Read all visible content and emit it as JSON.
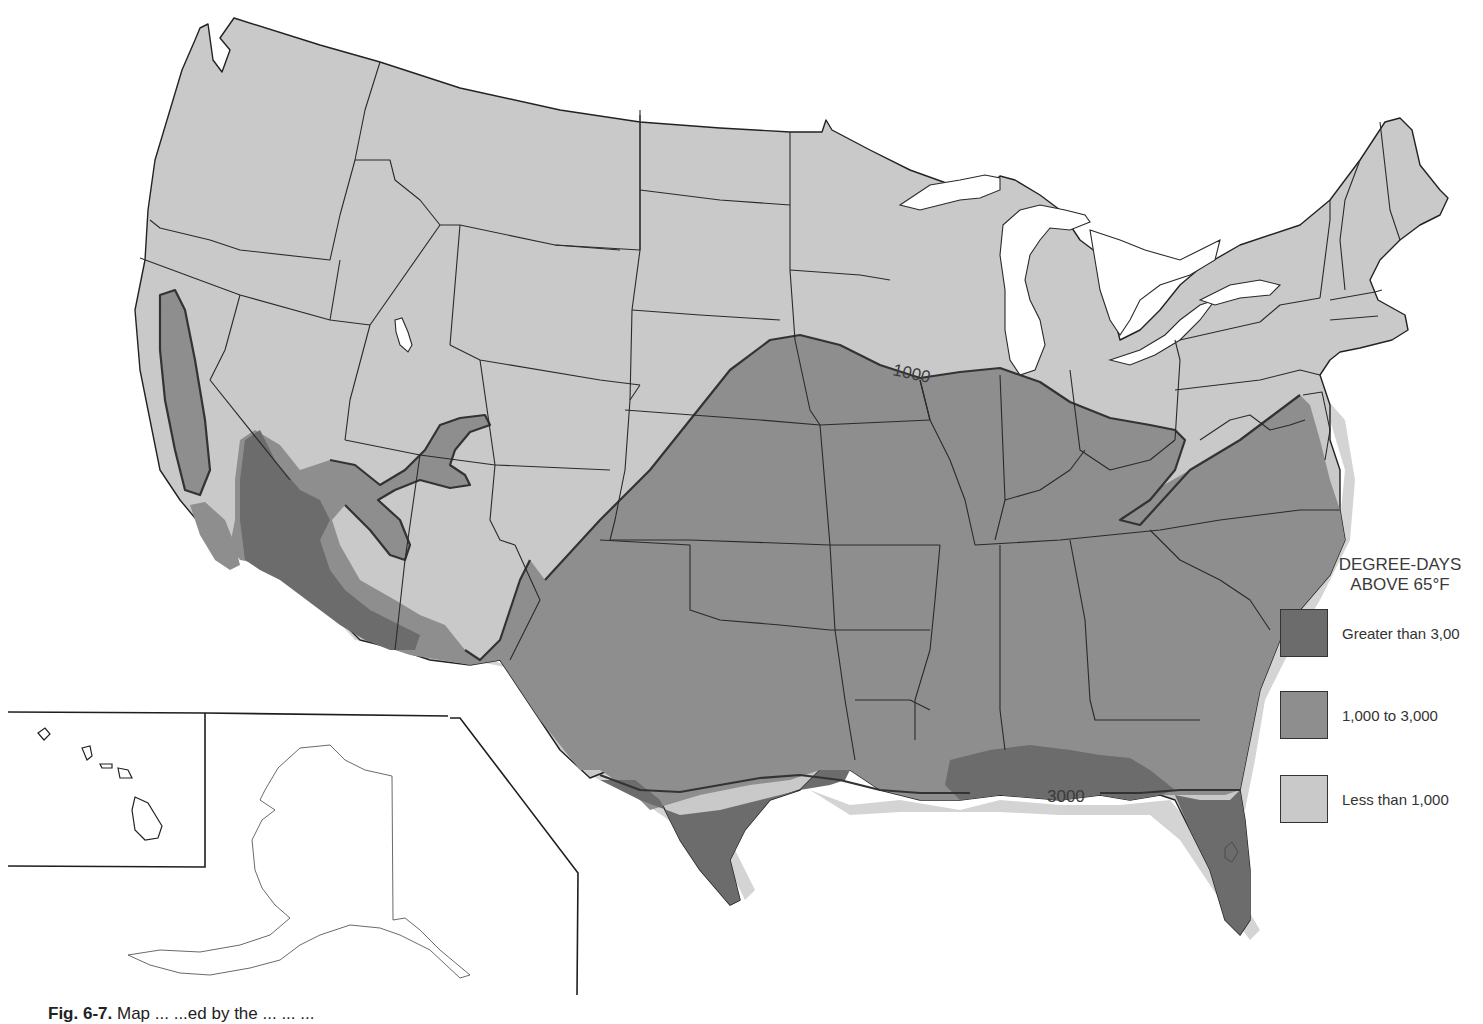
{
  "map": {
    "title": "Degree-days above 65°F, United States",
    "contour_labels": [
      {
        "id": "contour-1000",
        "text": "1000"
      },
      {
        "id": "contour-3000",
        "text": "3000"
      }
    ],
    "zones": [
      {
        "id": "less-than-1000",
        "color": "#c9c9c9"
      },
      {
        "id": "1000-to-3000",
        "color": "#8e8e8e"
      },
      {
        "id": "greater-than-3000",
        "color": "#6c6c6c"
      }
    ],
    "insets": [
      "Hawaii",
      "Alaska"
    ]
  },
  "legend": {
    "title_line1": "DEGREE-DAYS",
    "title_line2": "ABOVE 65°F",
    "items": [
      {
        "label": "Greater than 3,00",
        "color": "#6c6c6c"
      },
      {
        "label": "1,000 to 3,000",
        "color": "#8e8e8e"
      },
      {
        "label": "Less than 1,000",
        "color": "#c9c9c9"
      }
    ]
  },
  "caption": {
    "figure": "Fig. 6-7.",
    "text": "Map ... ...ed by the ... ... ..."
  }
}
